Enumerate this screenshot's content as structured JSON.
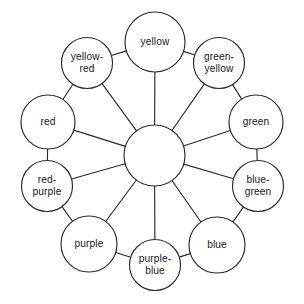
{
  "figure": {
    "name": "color-wheel-diagram",
    "type": "radial-node-diagram",
    "background_color": "#ffffff",
    "line_color": "#2b2b2b",
    "text_color": "#1a1a1a",
    "hub": {
      "label": "",
      "cx": 154.5,
      "cy": 155.5,
      "r": 30.5
    },
    "nodes": [
      {
        "id": "yellow",
        "label": "yellow",
        "lines": [
          "yellow"
        ],
        "cx": 155.0,
        "cy": 42.0,
        "r": 30.0,
        "angle_deg": 270
      },
      {
        "id": "green-yellow",
        "label": "green-yellow",
        "lines": [
          "green-",
          "yellow"
        ],
        "cx": 219.0,
        "cy": 63.0,
        "r": 25.5,
        "angle_deg": 306
      },
      {
        "id": "green",
        "label": "green",
        "lines": [
          "green"
        ],
        "cx": 256.0,
        "cy": 122.0,
        "r": 27.0,
        "angle_deg": 342
      },
      {
        "id": "blue-green",
        "label": "blue-green",
        "lines": [
          "blue-",
          "green"
        ],
        "cx": 258.0,
        "cy": 186.0,
        "r": 25.5,
        "angle_deg": 18
      },
      {
        "id": "blue",
        "label": "blue",
        "lines": [
          "blue"
        ],
        "cx": 217.0,
        "cy": 245.0,
        "r": 28.0,
        "angle_deg": 54
      },
      {
        "id": "purple-blue",
        "label": "purple-blue",
        "lines": [
          "purple-",
          "blue"
        ],
        "cx": 155.0,
        "cy": 265.0,
        "r": 25.5,
        "angle_deg": 90
      },
      {
        "id": "purple",
        "label": "purple",
        "lines": [
          "purple"
        ],
        "cx": 89.0,
        "cy": 244.0,
        "r": 28.0,
        "angle_deg": 126
      },
      {
        "id": "red-purple",
        "label": "red-purple",
        "lines": [
          "red-",
          "purple"
        ],
        "cx": 47.0,
        "cy": 186.0,
        "r": 25.5,
        "angle_deg": 162
      },
      {
        "id": "red",
        "label": "red",
        "lines": [
          "red"
        ],
        "cx": 48.0,
        "cy": 122.0,
        "r": 27.0,
        "angle_deg": 198
      },
      {
        "id": "yellow-red",
        "label": "yellow-red",
        "lines": [
          "yellow-",
          "red"
        ],
        "cx": 87.0,
        "cy": 63.0,
        "r": 25.5,
        "angle_deg": 234
      }
    ],
    "rim_pairs": [
      [
        "yellow",
        "green-yellow"
      ],
      [
        "green-yellow",
        "green"
      ],
      [
        "green",
        "blue-green"
      ],
      [
        "blue-green",
        "blue"
      ],
      [
        "blue",
        "purple-blue"
      ],
      [
        "purple-blue",
        "purple"
      ],
      [
        "purple",
        "red-purple"
      ],
      [
        "red-purple",
        "red"
      ],
      [
        "red",
        "yellow-red"
      ],
      [
        "yellow-red",
        "yellow"
      ]
    ]
  }
}
